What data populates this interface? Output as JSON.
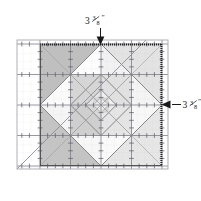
{
  "callouts": [
    {
      "id": "top",
      "value": "3",
      "fraction_numerator": "3",
      "fraction_denominator": "8",
      "unit": "”",
      "full_label": "3⅜”",
      "arrow_direction": "down",
      "arrow_target": "top-edge-of-block"
    },
    {
      "id": "right",
      "value": "3",
      "fraction_numerator": "3",
      "fraction_denominator": "8",
      "unit": "”",
      "full_label": "3⅜”",
      "arrow_direction": "left",
      "arrow_target": "right-edge-of-block"
    }
  ],
  "ruler": {
    "name": "transparent-quilting-ruler",
    "grid_major_spacing_in": 1,
    "grid_minor_ticks_per_major": 8,
    "has_45_degree_line": true,
    "line_color": "#8c8c99",
    "tick_color": "#6e6e7a"
  },
  "block": {
    "name": "fabric-block",
    "shape": "square",
    "edge_label_top": "3⅜”",
    "edge_label_right": "3⅜”",
    "border_style": "dotted-dark",
    "border_color": "#2b2b2b",
    "nested_shapes": "on-point squares (diamonds)"
  },
  "colors": {
    "shade_dark": "#b5b5b5",
    "shade_mid": "#c9c9c9",
    "shade_light": "#dcdcdc",
    "shade_lighter": "#e9e9e9",
    "white": "#ffffff",
    "outline": "#6a6a6a",
    "ink": "#1a1a1a",
    "grid": "#9a9aa4"
  }
}
